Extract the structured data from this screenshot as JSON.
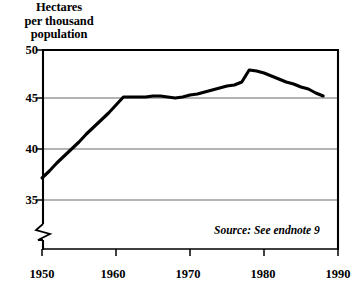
{
  "chart_data": {
    "type": "line",
    "title": "Hectares per thousand population",
    "title_lines": [
      "Hectares",
      "per thousand",
      "population"
    ],
    "xlabel": "",
    "ylabel": "Hectares per thousand population",
    "xlim": [
      1950,
      1990
    ],
    "ylim": [
      33.4,
      50
    ],
    "yaxis_break": true,
    "yaxis_break_note": "axis broken below 35",
    "grid": true,
    "grid_axis": "y",
    "legend": false,
    "legend_position": "none",
    "yticks": [
      35,
      40,
      45,
      50
    ],
    "ytick_labels": [
      "35",
      "40",
      "45",
      "50"
    ],
    "xticks": [
      1950,
      1960,
      1970,
      1980,
      1990
    ],
    "xtick_labels": [
      "1950",
      "1960",
      "1970",
      "1980",
      "1990"
    ],
    "annotations": [
      {
        "text": "Source: See endnote 9",
        "x": 1983,
        "y": 34.2,
        "style": "italic"
      }
    ],
    "series": [
      {
        "name": "Grainland area per thousand population",
        "color": "#000000",
        "x": [
          1950,
          1951,
          1952,
          1953,
          1954,
          1955,
          1956,
          1957,
          1958,
          1959,
          1960,
          1961,
          1962,
          1963,
          1964,
          1965,
          1966,
          1967,
          1968,
          1969,
          1970,
          1971,
          1972,
          1973,
          1974,
          1975,
          1976,
          1977,
          1978,
          1979,
          1980,
          1981,
          1982,
          1983,
          1984,
          1985,
          1986,
          1987,
          1988
        ],
        "values": [
          37.2,
          37.9,
          38.7,
          39.4,
          40.1,
          40.8,
          41.6,
          42.3,
          43.0,
          43.7,
          44.5,
          45.3,
          45.3,
          45.3,
          45.3,
          45.4,
          45.4,
          45.3,
          45.2,
          45.3,
          45.5,
          45.6,
          45.8,
          46.0,
          46.2,
          46.4,
          46.5,
          46.8,
          48.0,
          47.9,
          47.7,
          47.4,
          47.1,
          46.8,
          46.6,
          46.3,
          46.1,
          45.7,
          45.4
        ]
      }
    ]
  },
  "axes": {
    "y_label_50": "50",
    "y_label_45": "45",
    "y_label_40": "40",
    "y_label_35": "35",
    "x_label_1950": "1950",
    "x_label_1960": "1960",
    "x_label_1970": "1970",
    "x_label_1980": "1980",
    "x_label_1990": "1990"
  },
  "title": {
    "line1": "Hectares",
    "line2": "per thousand",
    "line3": "population"
  },
  "source": {
    "text": "Source: See endnote 9"
  },
  "colors": {
    "line": "#000000",
    "grid": "#6b6b6b",
    "frame": "#000000",
    "background": "#ffffff"
  }
}
